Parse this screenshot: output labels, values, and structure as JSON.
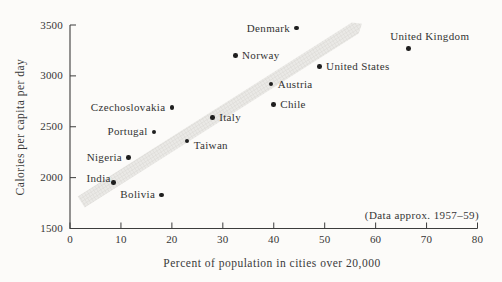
{
  "chart_data": {
    "type": "scatter",
    "title": "",
    "xlabel": "Percent of population in cities over 20,000",
    "ylabel": "Calories per capita per day",
    "annotation": "(Data approx. 1957–59)",
    "xlim": [
      0,
      80
    ],
    "ylim": [
      1500,
      3500
    ],
    "x_ticks": [
      "0",
      "10",
      "20",
      "30",
      "40",
      "50",
      "60",
      "70",
      "80"
    ],
    "y_ticks": [
      "1500",
      "2000",
      "2500",
      "3000",
      "3500"
    ],
    "grid": false,
    "legend": "none",
    "points": [
      {
        "country": "Denmark",
        "percent": 44.5,
        "calories": 3470,
        "label_side": "left"
      },
      {
        "country": "United Kingdom",
        "percent": 66.5,
        "calories": 3270,
        "label_side": "above"
      },
      {
        "country": "Norway",
        "percent": 32.5,
        "calories": 3200,
        "label_side": "right"
      },
      {
        "country": "United States",
        "percent": 49,
        "calories": 3090,
        "label_side": "right"
      },
      {
        "country": "Austria",
        "percent": 39.5,
        "calories": 2920,
        "label_side": "right"
      },
      {
        "country": "Chile",
        "percent": 40,
        "calories": 2720,
        "label_side": "right"
      },
      {
        "country": "Czechoslovakia",
        "percent": 20,
        "calories": 2690,
        "label_side": "left"
      },
      {
        "country": "Italy",
        "percent": 28,
        "calories": 2590,
        "label_side": "right"
      },
      {
        "country": "Portugal",
        "percent": 16.5,
        "calories": 2450,
        "label_side": "left"
      },
      {
        "country": "Taiwan",
        "percent": 23,
        "calories": 2360,
        "label_side": "right-below"
      },
      {
        "country": "Nigeria",
        "percent": 11.5,
        "calories": 2200,
        "label_side": "left"
      },
      {
        "country": "India",
        "percent": 8.5,
        "calories": 1950,
        "label_side": "left-above"
      },
      {
        "country": "Bolivia",
        "percent": 18,
        "calories": 1830,
        "label_side": "left"
      }
    ],
    "trend_band": {
      "x_start": 2.2,
      "y_start": 1760,
      "x_end": 56,
      "y_end": 3470,
      "width_px": 13,
      "tip_px": 8,
      "fill": "#eae9e6",
      "hatch": "#d9d7d3"
    },
    "ink_color": "#3c3c3c",
    "dot_color": "#1f1f1f"
  }
}
